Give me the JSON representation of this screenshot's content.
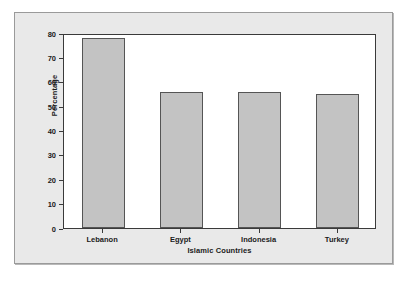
{
  "chart_data": {
    "type": "bar",
    "title": "",
    "subtitle": "",
    "categories": [
      "Lebanon",
      "Egypt",
      "Indonesia",
      "Turkey"
    ],
    "values": [
      78,
      56,
      56,
      55
    ],
    "xlabel": "Islamic Countries",
    "ylabel": "Percentage",
    "ylim": [
      0,
      80
    ],
    "yticks": [
      0,
      10,
      20,
      30,
      40,
      50,
      60,
      70,
      80
    ],
    "ytick_labels": [
      "0",
      "10",
      "20",
      "30",
      "40",
      "50",
      "60",
      "70",
      "80"
    ],
    "grid": false,
    "legend": null,
    "bar_color": "#c3c3c3",
    "bar_edge_color": "#555555",
    "plot_background": "#ffffff",
    "panel_background": "#e9e9e9",
    "axis_color": "#3a3a3a",
    "text_color": "#1a1a1a"
  }
}
